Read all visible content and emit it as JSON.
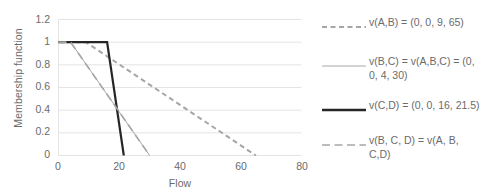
{
  "chart_data": {
    "type": "line",
    "title": "",
    "xlabel": "Flow",
    "ylabel": "Membership function",
    "xlim": [
      0,
      80
    ],
    "ylim": [
      0,
      1.2
    ],
    "xticks": [
      "0",
      "20",
      "40",
      "60",
      "80"
    ],
    "xtick_values": [
      0,
      20,
      40,
      60,
      80
    ],
    "yticks": [
      "0",
      "0.2",
      "0.4",
      "0.6",
      "0.8",
      "1",
      "1.2"
    ],
    "ytick_values": [
      0,
      0.2,
      0.4,
      0.6,
      0.8,
      1,
      1.2
    ],
    "grid": true,
    "legend_position": "right",
    "series": [
      {
        "name": "v(A,B) =  (0, 0, 9, 65)",
        "style": "dashed",
        "color": "#a6a6a6",
        "width": 2,
        "x": [
          0,
          9,
          65
        ],
        "y": [
          1,
          1,
          0
        ]
      },
      {
        "name": "v(B,C) = v(A,B,C)  = (0, 0, 4, 30)",
        "style": "solid",
        "color": "#a6a6a6",
        "width": 1,
        "x": [
          0,
          4,
          30
        ],
        "y": [
          1,
          1,
          0
        ]
      },
      {
        "name": "v(C,D) =  (0, 0, 16, 21.5)",
        "style": "solid",
        "color": "#262626",
        "width": 2.2,
        "x": [
          0,
          16,
          21.5
        ],
        "y": [
          1,
          1,
          0
        ]
      },
      {
        "name": "v(B, C, D)   = v(A, B, C,D)",
        "style": "longdash",
        "color": "#a6a6a6",
        "width": 1.6,
        "x": [
          0,
          4,
          30
        ],
        "y": [
          1,
          1,
          0
        ]
      }
    ]
  },
  "axes": {
    "y_title": "Membership function",
    "x_title": "Flow",
    "y_labels": [
      "1.2",
      "1",
      "0.8",
      "0.6",
      "0.4",
      "0.2",
      "0"
    ],
    "x_labels": [
      "0",
      "20",
      "40",
      "60",
      "80"
    ]
  },
  "legend": {
    "entries": [
      {
        "label": "v(A,B) =  (0, 0, 9, 65)"
      },
      {
        "label": "v(B,C) = v(A,B,C)  = (0,\n0, 4, 30)"
      },
      {
        "label": "v(C,D) =  (0, 0, 16, 21.5)"
      },
      {
        "label": "v(B, C, D)   = v(A, B,\nC,D)"
      }
    ]
  },
  "colors": {
    "gray_series": "#a6a6a6",
    "black_series": "#262626",
    "gridline": "#e4e4e4",
    "text": "#6b6b6b"
  }
}
